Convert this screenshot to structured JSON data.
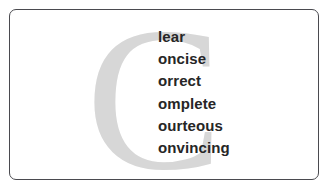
{
  "slide": {
    "background_color": "#ffffff",
    "card": {
      "border_color": "#4a4a4f",
      "background_color": "#ffffff",
      "corner_radius": "7px"
    }
  },
  "watermark": {
    "letter": "C",
    "color": "#d7d7d7",
    "role": "shared-initial-letter"
  },
  "word_list": {
    "items": [
      {
        "suffix": "lear",
        "full_word": "Clear"
      },
      {
        "suffix": "oncise",
        "full_word": "Concise"
      },
      {
        "suffix": "orrect",
        "full_word": "Correct"
      },
      {
        "suffix": "omplete",
        "full_word": "Complete"
      },
      {
        "suffix": "ourteous",
        "full_word": "Courteous"
      },
      {
        "suffix": "onvincing",
        "full_word": "Convincing"
      }
    ],
    "text_color": "#262626"
  }
}
